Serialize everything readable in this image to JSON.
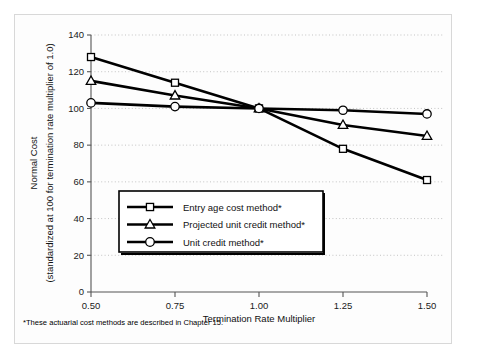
{
  "chart_data": {
    "type": "line",
    "title": "",
    "subtitle": "",
    "xlabel": "Termination Rate Multiplier",
    "ylabel": "Normal Cost",
    "ylabel_line2": "(standardized at 100 for termination rate multiplier of 1.0)",
    "x": [
      0.5,
      0.75,
      1.0,
      1.25,
      1.5
    ],
    "xtick_labels": [
      "0.50",
      "0.75",
      "1.00",
      "1.25",
      "1.50"
    ],
    "ytick_labels": [
      "0",
      "20",
      "40",
      "60",
      "80",
      "100",
      "120",
      "140"
    ],
    "ytick_values": [
      0,
      20,
      40,
      60,
      80,
      100,
      120,
      140
    ],
    "xlim": [
      0.5,
      1.5
    ],
    "ylim": [
      0,
      140
    ],
    "grid": "horizontal-dotted",
    "legend_position": "center-left-inside",
    "series": [
      {
        "name": "Entry age cost method*",
        "marker": "square",
        "values": [
          128,
          114,
          100,
          78,
          61
        ]
      },
      {
        "name": "Projected unit credit method*",
        "marker": "triangle",
        "values": [
          115,
          107,
          100,
          91,
          85
        ]
      },
      {
        "name": "Unit credit method*",
        "marker": "circle",
        "values": [
          103,
          101,
          100,
          99,
          97
        ]
      }
    ],
    "footnote": "*These actuarial cost methods are described in Chapter 15.",
    "colors": {
      "line": "#000000",
      "marker_fill": "#ffffff",
      "marker_stroke": "#000000",
      "grid": "#b9b9b9",
      "axis": "#555555",
      "frame": "#d8d8d8",
      "background": "#fdfdfd"
    }
  }
}
